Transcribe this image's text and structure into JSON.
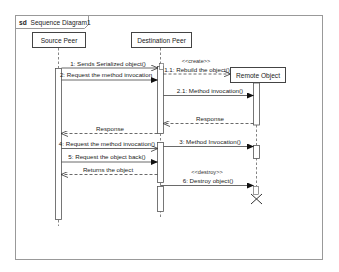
{
  "frame": {
    "keyword": "sd",
    "title": "Sequence Diagram1"
  },
  "lifelines": [
    {
      "id": "source",
      "label": "Source Peer"
    },
    {
      "id": "destination",
      "label": "Destination Peer"
    },
    {
      "id": "remote",
      "label": "Remote Object"
    }
  ],
  "messages": [
    {
      "label": "1: Sends Serialized object()",
      "from": "source",
      "to": "destination",
      "kind": "async"
    },
    {
      "label": "1.1: Rebuild the object()",
      "stereotype": "<<create>>",
      "from": "destination",
      "to": "remote",
      "kind": "create"
    },
    {
      "label": "2: Request the method invocation",
      "from": "source",
      "to": "destination",
      "kind": "sync"
    },
    {
      "label": "2.1: Method invocation()",
      "from": "destination",
      "to": "remote",
      "kind": "sync"
    },
    {
      "label": "Response",
      "from": "remote",
      "to": "destination",
      "kind": "reply"
    },
    {
      "label": "Response",
      "from": "destination",
      "to": "source",
      "kind": "reply"
    },
    {
      "label": "4: Request the method invocation()",
      "from": "source",
      "to": "destination",
      "kind": "async"
    },
    {
      "label": "3: Method Invocation()",
      "from": "destination",
      "to": "remote",
      "kind": "sync"
    },
    {
      "label": "5: Request the object back()",
      "from": "source",
      "to": "destination",
      "kind": "sync"
    },
    {
      "label": "Returns the object",
      "from": "destination",
      "to": "source",
      "kind": "reply"
    },
    {
      "label": "6: Destroy object()",
      "stereotype": "<<destroy>>",
      "from": "destination",
      "to": "remote",
      "kind": "destroy"
    }
  ],
  "colors": {
    "line": "#555555",
    "frame": "#888888",
    "text": "#222222"
  }
}
